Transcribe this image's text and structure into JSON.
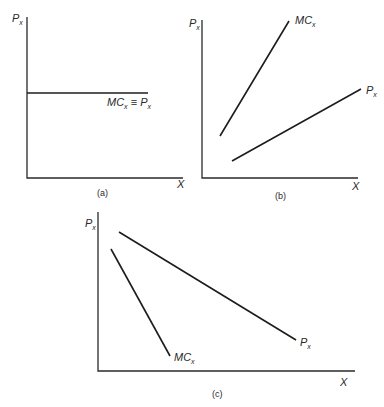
{
  "figure": {
    "panels": [
      {
        "id": "a",
        "caption": "(a)",
        "y_axis_label": {
          "main": "P",
          "sub": "x"
        },
        "x_axis_label": "X",
        "curves": [
          {
            "name": "MC_x ≡ P_x",
            "label_main1": "MC",
            "label_sub1": "x",
            "label_eq": " ≡ ",
            "label_main2": "P",
            "label_sub2": "x",
            "shape": "horizontal"
          }
        ]
      },
      {
        "id": "b",
        "caption": "(b)",
        "y_axis_label": {
          "main": "P",
          "sub": "x"
        },
        "x_axis_label": "X",
        "curves": [
          {
            "name": "MC_x",
            "label_main": "MC",
            "label_sub": "x",
            "shape": "upward sloping, steep"
          },
          {
            "name": "P_x",
            "label_main": "P",
            "label_sub": "x",
            "shape": "upward sloping, shallow"
          }
        ]
      },
      {
        "id": "c",
        "caption": "(c)",
        "y_axis_label": {
          "main": "P",
          "sub": "x"
        },
        "x_axis_label": "X",
        "curves": [
          {
            "name": "MC_x",
            "label_main": "MC",
            "label_sub": "x",
            "shape": "downward sloping, steep"
          },
          {
            "name": "P_x",
            "label_main": "P",
            "label_sub": "x",
            "shape": "downward sloping, shallow"
          }
        ]
      }
    ]
  }
}
